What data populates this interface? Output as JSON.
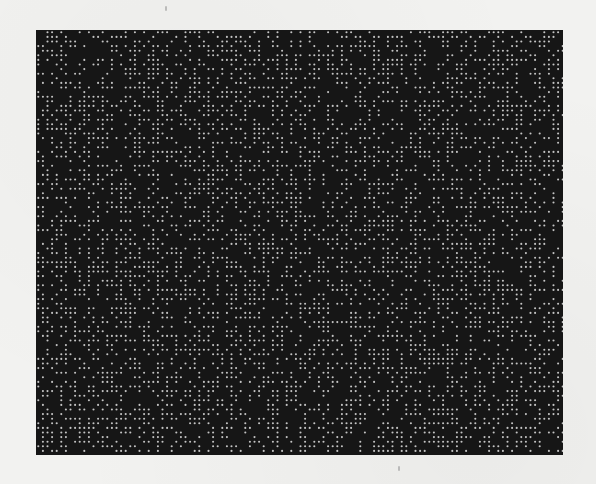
{
  "figure": {
    "kind": "random-dot pattern (scanned page)",
    "rect": {
      "x": 36,
      "y": 30,
      "width": 527,
      "height": 425
    },
    "background_color": "#161616",
    "dot_color": "#c4c4c4",
    "grid_pitch_px": 4.6,
    "dot_diameter_px": 2.1,
    "fill_density": 0.42,
    "seed": 1337
  },
  "page": {
    "paper_color": "#f2f2f0",
    "specks": [
      {
        "x": 165,
        "y": 6
      },
      {
        "x": 398,
        "y": 466
      }
    ]
  }
}
